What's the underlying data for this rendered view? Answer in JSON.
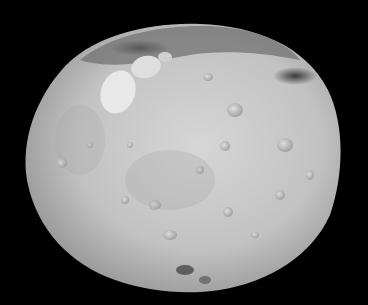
{
  "image": {
    "subject": "asteroid",
    "description": "Grayscale photograph of a cratered asteroid against a black background",
    "colors": {
      "background": "#000000",
      "surface_light": "#d2d2d2",
      "surface_mid": "#a8a8a8",
      "surface_dark": "#4a4a4a",
      "highlight": "#eeeeee"
    }
  }
}
